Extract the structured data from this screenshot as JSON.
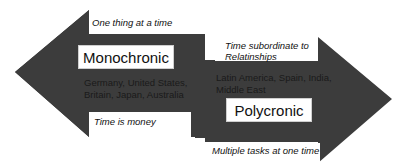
{
  "diagram": {
    "colors": {
      "arrow": "#3c3c3c",
      "background": "#ffffff",
      "text": "#111111"
    },
    "left_arrow": {
      "direction": "left",
      "title": "Monochronic",
      "top_caption": "One thing at a time",
      "countries_line1": "Germany, United States,",
      "countries_line2": "Britain, Japan, Australia",
      "bottom_caption": "Time is money"
    },
    "right_arrow": {
      "direction": "right",
      "title": "Polycronic",
      "top_caption_line1": "Time subordinate to",
      "top_caption_line2": "Relatinships",
      "countries_line1": "Latin America, Spain, India,",
      "countries_line2": "Middle East",
      "bottom_caption": "Multiple tasks at one time"
    }
  }
}
